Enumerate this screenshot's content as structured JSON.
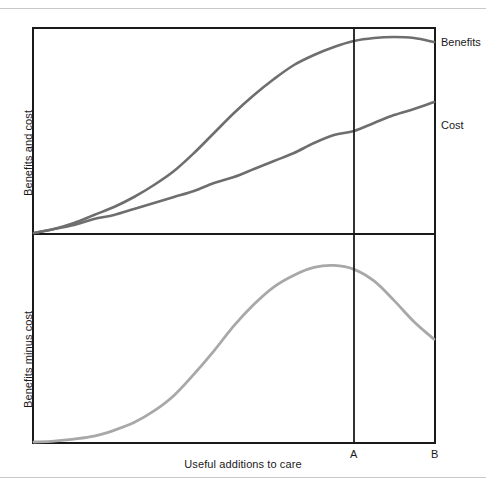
{
  "figure": {
    "top_rule": true,
    "bottom_rule": true,
    "rule_color": "#c9c9c9"
  },
  "axes": {
    "top_panel": {
      "ylabel": "Benefits and cost"
    },
    "bottom_panel": {
      "ylabel": "Benefits minus cost"
    },
    "xlabel": "Useful additions to care",
    "tick_labels": [
      "A",
      "B"
    ]
  },
  "series_labels": {
    "benefits": "Benefits",
    "cost": "Cost"
  },
  "colors": {
    "frame": "#1a1a1a",
    "benefits_curve": "#6e6e6e",
    "cost_curve": "#6e6e6e",
    "net_curve": "#a8a8a8",
    "marker_line": "#1a1a1a",
    "background": "#ffffff"
  },
  "chart_data": {
    "type": "line",
    "title": "",
    "subtitle": "",
    "xlabel": "Useful additions to care",
    "grid": false,
    "legend": "right-inline",
    "annotations": [
      {
        "label": "A",
        "type": "vertical-line",
        "x": 0.8,
        "note": "point of maximum net benefit"
      },
      {
        "label": "B",
        "type": "axis-endpoint",
        "x": 1.0,
        "note": "right edge of useful additions"
      }
    ],
    "panels": [
      {
        "name": "top",
        "ylabel": "Benefits and cost",
        "xlim": [
          0,
          1
        ],
        "ylim": [
          0,
          1
        ],
        "xticks": [
          0.8,
          1.0
        ],
        "xticklabels": [
          "A",
          "B"
        ],
        "yticks": [],
        "yticklabels": [],
        "series": [
          {
            "name": "Benefits",
            "color": "#6e6e6e",
            "x": [
              0.0,
              0.05,
              0.1,
              0.15,
              0.2,
              0.25,
              0.3,
              0.35,
              0.4,
              0.45,
              0.5,
              0.55,
              0.6,
              0.65,
              0.7,
              0.75,
              0.8,
              0.85,
              0.9,
              0.95,
              1.0
            ],
            "values": [
              0.0,
              0.02,
              0.05,
              0.09,
              0.13,
              0.18,
              0.24,
              0.31,
              0.4,
              0.5,
              0.6,
              0.69,
              0.77,
              0.84,
              0.89,
              0.93,
              0.96,
              0.975,
              0.98,
              0.975,
              0.955
            ]
          },
          {
            "name": "Cost",
            "color": "#6e6e6e",
            "x": [
              0.0,
              0.05,
              0.1,
              0.15,
              0.2,
              0.25,
              0.3,
              0.35,
              0.4,
              0.45,
              0.5,
              0.55,
              0.6,
              0.65,
              0.7,
              0.75,
              0.8,
              0.85,
              0.9,
              0.95,
              1.0
            ],
            "values": [
              0.0,
              0.02,
              0.04,
              0.07,
              0.09,
              0.12,
              0.15,
              0.18,
              0.21,
              0.25,
              0.28,
              0.32,
              0.36,
              0.4,
              0.45,
              0.49,
              0.51,
              0.55,
              0.59,
              0.62,
              0.655
            ]
          }
        ]
      },
      {
        "name": "bottom",
        "ylabel": "Benefits minus cost",
        "xlim": [
          0,
          1
        ],
        "ylim": [
          0,
          1
        ],
        "xticks": [
          0.8,
          1.0
        ],
        "xticklabels": [
          "A",
          "B"
        ],
        "yticks": [],
        "yticklabels": [],
        "series": [
          {
            "name": "Benefits minus cost",
            "color": "#a8a8a8",
            "x": [
              0.0,
              0.05,
              0.1,
              0.15,
              0.2,
              0.25,
              0.3,
              0.35,
              0.4,
              0.45,
              0.5,
              0.55,
              0.6,
              0.65,
              0.7,
              0.75,
              0.8,
              0.85,
              0.9,
              0.95,
              1.0
            ],
            "values": [
              0.0,
              0.005,
              0.015,
              0.03,
              0.06,
              0.1,
              0.16,
              0.24,
              0.35,
              0.47,
              0.6,
              0.71,
              0.8,
              0.86,
              0.9,
              0.91,
              0.89,
              0.83,
              0.73,
              0.62,
              0.53
            ]
          }
        ]
      }
    ]
  }
}
